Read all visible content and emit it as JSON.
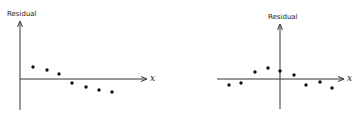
{
  "chart_data": [
    {
      "type": "scatter",
      "title": "",
      "xlabel": "x",
      "ylabel": "Residual",
      "grid": false,
      "description": "Residuals decreasing linearly with x (pattern indicates non-constant mean / linear trend)",
      "points_px": [
        [
          33,
          67
        ],
        [
          47,
          70
        ],
        [
          59,
          74
        ],
        [
          72,
          83
        ],
        [
          86,
          87
        ],
        [
          99,
          90
        ],
        [
          112,
          92
        ]
      ],
      "axes_px": {
        "origin_x": 20,
        "axis_y": 79,
        "y_top": 22,
        "y_bottom": 110,
        "x_right": 146
      },
      "y_values_relative": [
        12,
        9,
        5,
        -4,
        -8,
        -11,
        -13
      ]
    },
    {
      "type": "scatter",
      "title": "",
      "xlabel": "x",
      "ylabel": "Residual",
      "grid": false,
      "description": "Residuals with curved (inverted-U) pattern across x",
      "points_px": [
        [
          229,
          85
        ],
        [
          241,
          83
        ],
        [
          255,
          72
        ],
        [
          268,
          68
        ],
        [
          280,
          71
        ],
        [
          294,
          75
        ],
        [
          306,
          85
        ],
        [
          320,
          82
        ],
        [
          332,
          88
        ]
      ],
      "axes_px": {
        "origin_x": 280,
        "axis_y": 79,
        "y_top": 25,
        "y_bottom": 109,
        "x_left": 217,
        "x_right": 343
      },
      "y_values_relative": [
        -6,
        -4,
        7,
        11,
        8,
        4,
        -6,
        -3,
        -9
      ]
    }
  ],
  "labels": {
    "left_ylabel": "Residual",
    "left_xlabel": "x",
    "right_ylabel": "Residual",
    "right_xlabel": "x"
  }
}
